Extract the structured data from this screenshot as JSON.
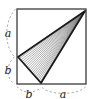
{
  "figure": {
    "type": "geometry-diagram",
    "background_color": "#ffffff",
    "stroke_color": "#1a1a1a",
    "hatch_color": "#6b6b6b",
    "dashed_color": "#9a9a9a",
    "square": {
      "name": "outer-square",
      "left": 17,
      "top": 9,
      "right": 86,
      "bottom": 84,
      "stroke_width": 1.4
    },
    "triangle": {
      "name": "hatched-triangle",
      "fill": "hatched-diagonal-lines",
      "stroke_width": 1.8,
      "vertices": [
        {
          "name": "apex-top-right",
          "x": 85,
          "y": 11
        },
        {
          "name": "vertex-left-edge",
          "x": 18,
          "y": 57
        },
        {
          "name": "vertex-bottom-edge",
          "x": 41,
          "y": 83
        }
      ]
    },
    "labels": [
      {
        "id": "left-upper",
        "text": "a",
        "x": 7,
        "y": 34,
        "edge": "left",
        "segment": "top-to-left-vertex"
      },
      {
        "id": "left-lower",
        "text": "b",
        "x": 7,
        "y": 71,
        "edge": "left",
        "segment": "left-vertex-to-bottom"
      },
      {
        "id": "bottom-left",
        "text": "b",
        "x": 28,
        "y": 96,
        "edge": "bottom",
        "segment": "bottom-left-to-vertex"
      },
      {
        "id": "bottom-right",
        "text": "a",
        "x": 62,
        "y": 96,
        "edge": "bottom",
        "segment": "vertex-to-bottom-right"
      }
    ],
    "brackets": [
      {
        "id": "left-a",
        "label": "a",
        "style": "dashed-arc",
        "side": "left",
        "from_y": 9,
        "to_y": 57
      },
      {
        "id": "left-b",
        "label": "b",
        "style": "dashed-arc",
        "side": "left",
        "from_y": 57,
        "to_y": 84
      },
      {
        "id": "bottom-b",
        "label": "b",
        "style": "dashed-arc",
        "side": "bottom",
        "from_x": 17,
        "to_x": 41
      },
      {
        "id": "bottom-a",
        "label": "a",
        "style": "dashed-arc",
        "side": "bottom",
        "from_x": 41,
        "to_x": 86
      }
    ]
  }
}
